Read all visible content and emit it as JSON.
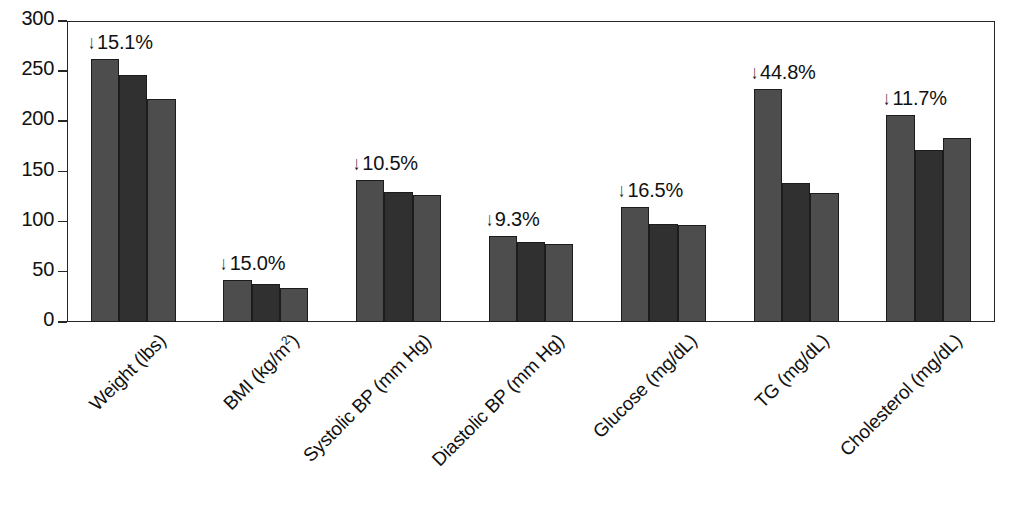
{
  "chart_data": {
    "type": "bar",
    "title": "",
    "subtitle": "",
    "xlabel": "",
    "ylabel": "",
    "ylim": [
      0,
      300
    ],
    "yticks": [
      0,
      50,
      100,
      150,
      200,
      250,
      300
    ],
    "grid": false,
    "legend": "none",
    "orientation": "vertical",
    "grouped": true,
    "bars_per_group": 3,
    "categories": [
      "Weight (lbs)",
      "BMI (kg/m2)",
      "Systolic BP (mm Hg)",
      "Diastolic BP (mm Hg)",
      "Glucose (mg/dL)",
      "TG (mg/dL)",
      "Cholesterol (mg/dL)"
    ],
    "series": [
      {
        "name": "bar-1",
        "values": [
          262,
          42,
          142,
          86,
          115,
          232,
          206
        ]
      },
      {
        "name": "bar-2",
        "values": [
          246,
          38,
          130,
          80,
          98,
          139,
          171
        ]
      },
      {
        "name": "bar-3",
        "values": [
          222,
          34,
          127,
          78,
          97,
          129,
          183
        ]
      }
    ],
    "annotations": [
      {
        "category": "Weight (lbs)",
        "text": "15.1%",
        "arrow": "↓"
      },
      {
        "category": "BMI (kg/m2)",
        "text": "15.0%",
        "arrow": "↓"
      },
      {
        "category": "Systolic BP (mm Hg)",
        "text": "10.5%",
        "arrow": "↓"
      },
      {
        "category": "Diastolic BP (mm Hg)",
        "text": "9.3%",
        "arrow": "↓"
      },
      {
        "category": "Glucose (mg/dL)",
        "text": "16.5%",
        "arrow": "↓"
      },
      {
        "category": "TG (mg/dL)",
        "text": "44.8%",
        "arrow": "↓"
      },
      {
        "category": "Cholesterol (mg/dL)",
        "text": "11.7%",
        "arrow": "↓"
      }
    ],
    "colors": {
      "bar_light": "#4d4d4d",
      "bar_dark": "#303030",
      "axis": "#262626",
      "text": "#111111",
      "background": "#ffffff"
    }
  },
  "axis": {
    "y_tick_labels": [
      "300",
      "250",
      "200",
      "150",
      "100",
      "50",
      "0"
    ]
  },
  "x_axis_labels": [
    {
      "pre": "Weight (lbs)",
      "sup": "",
      "post": ""
    },
    {
      "pre": "BMI (kg/m",
      "sup": "2",
      "post": ")"
    },
    {
      "pre": "Systolic BP (mm Hg)",
      "sup": "",
      "post": ""
    },
    {
      "pre": "Diastolic BP (mm Hg)",
      "sup": "",
      "post": ""
    },
    {
      "pre": "Glucose (mg/dL)",
      "sup": "",
      "post": ""
    },
    {
      "pre": "TG (mg/dL)",
      "sup": "",
      "post": ""
    },
    {
      "pre": "Cholesterol (mg/dL)",
      "sup": "",
      "post": ""
    }
  ]
}
